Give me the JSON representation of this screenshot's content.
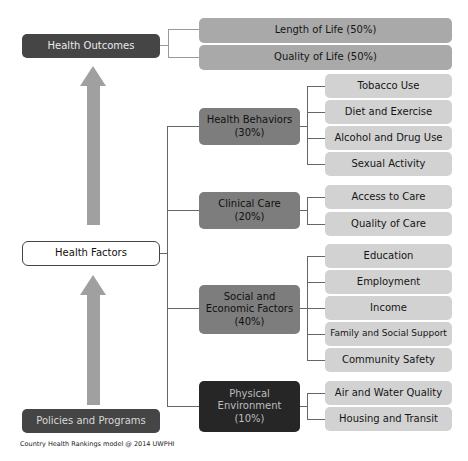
{
  "diagram": {
    "health_outcomes": "Health Outcomes",
    "outcomes": [
      {
        "label": "Length of Life (50%)"
      },
      {
        "label": "Quality of Life (50%)"
      }
    ],
    "health_factors": "Health Factors",
    "policies": "Policies and Programs",
    "caption": "Country Health Rankings model @ 2014 UWPHI",
    "factors": [
      {
        "label_line1": "Health Behaviors",
        "label_line2": "(30%)",
        "label_line3": "",
        "items": [
          "Tobacco Use",
          "Diet and Exercise",
          "Alcohol and Drug Use",
          "Sexual Activity"
        ]
      },
      {
        "label_line1": "Clinical Care",
        "label_line2": "(20%)",
        "label_line3": "",
        "items": [
          "Access to Care",
          "Quality of Care"
        ]
      },
      {
        "label_line1": "Social and",
        "label_line2": "Economic Factors",
        "label_line3": "(40%)",
        "items": [
          "Education",
          "Employment",
          "Income",
          "Family and Social Support",
          "Community Safety"
        ]
      },
      {
        "label_line1": "Physical",
        "label_line2": "Environment",
        "label_line3": "(10%)",
        "items": [
          "Air and Water Quality",
          "Housing and Transit"
        ]
      }
    ]
  }
}
